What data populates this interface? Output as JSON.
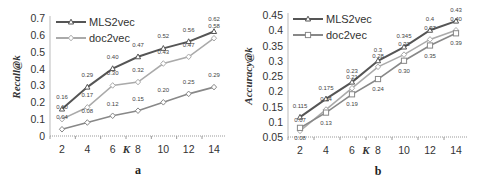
{
  "chart_data": [
    {
      "type": "line",
      "panel": "a",
      "title": "",
      "caption": "a",
      "xlabel": "K",
      "ylabel": "Recall@k",
      "x": [
        2,
        4,
        6,
        8,
        10,
        12,
        14
      ],
      "ylim": [
        0,
        0.7
      ],
      "yticks": [
        "0",
        "0.1",
        "0.2",
        "0.3",
        "0.4",
        "0.5",
        "0.6",
        "0.7"
      ],
      "legend": [
        "MLS2vec",
        "doc2vec"
      ],
      "legend_position": "upper left",
      "series": [
        {
          "name": "MLS2vec",
          "color": "#555555",
          "marker": "triangle",
          "values": [
            0.16,
            0.29,
            0.4,
            0.47,
            0.52,
            0.56,
            0.62
          ],
          "labels": [
            "0.16",
            "0.29",
            "0.40",
            "0.47",
            "0.52",
            "0.56",
            "0.62"
          ]
        },
        {
          "name": "doc2vec",
          "color": "#aaaaaa",
          "marker": "diamond",
          "values": [
            0.1,
            0.17,
            0.3,
            0.32,
            0.43,
            0.47,
            0.58
          ],
          "labels": [
            "0.10",
            "0.17",
            "0.30",
            "0.32",
            "0.43",
            "0.47",
            "0.58"
          ]
        },
        {
          "name": "",
          "color": "#888888",
          "marker": "diamond",
          "values": [
            0.04,
            0.08,
            0.12,
            0.15,
            0.2,
            0.25,
            0.29
          ],
          "labels": [
            "0.04",
            "0.08",
            "0.12",
            "0.15",
            "0.20",
            "0.25",
            "0.29"
          ]
        }
      ]
    },
    {
      "type": "line",
      "panel": "b",
      "title": "",
      "caption": "b",
      "xlabel": "K",
      "ylabel": "Accuracy@k",
      "x": [
        2,
        4,
        6,
        8,
        10,
        12,
        14
      ],
      "ylim": [
        0.05,
        0.45
      ],
      "yticks": [
        "0.05",
        "0.1",
        "0.15",
        "0.2",
        "0.25",
        "0.3",
        "0.35",
        "0.4",
        "0.45"
      ],
      "legend": [
        "MLS2vec",
        "doc2vec"
      ],
      "legend_position": "upper left",
      "series": [
        {
          "name": "MLS2vec",
          "color": "#555555",
          "marker": "triangle",
          "values": [
            0.115,
            0.175,
            0.23,
            0.3,
            0.345,
            0.4,
            0.43
          ],
          "labels": [
            "0.115",
            "0.175",
            "0.23",
            "0.3",
            "0.345",
            "0.4",
            "0.43"
          ]
        },
        {
          "name": "",
          "color": "#aaaaaa",
          "marker": "diamond",
          "values": [
            0.07,
            0.14,
            0.21,
            0.28,
            0.32,
            0.37,
            0.4
          ],
          "labels": [
            "0.07",
            "0.14",
            "0.21",
            "0.28",
            "0.32",
            "0.37",
            "0.40"
          ]
        },
        {
          "name": "doc2vec",
          "color": "#888888",
          "marker": "square",
          "values": [
            0.08,
            0.13,
            0.19,
            0.24,
            0.3,
            0.35,
            0.39
          ],
          "labels": [
            "0.08",
            "0.13",
            "0.19",
            "0.24",
            "0.30",
            "0.35",
            "0.39"
          ]
        }
      ]
    }
  ]
}
